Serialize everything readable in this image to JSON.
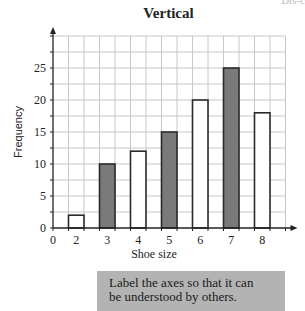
{
  "page_corner": "Dis-c",
  "title": "Vertical",
  "callout": {
    "line1": "Label the axes so that it can",
    "line2": "be understood by others."
  },
  "colors": {
    "grid": "#c8c8c8",
    "axis": "#222222",
    "bar_outline": "#2a2a2a",
    "bar_shaded": "#7a7a7a",
    "bar_unshaded": "#ffffff",
    "callout_bg": "#b3b3b3"
  },
  "chart_data": {
    "type": "bar",
    "title": "Vertical",
    "xlabel": "Shoe size",
    "ylabel": "Frequency",
    "categories": [
      "2",
      "3",
      "4",
      "5",
      "6",
      "7",
      "8"
    ],
    "values": [
      2,
      10,
      12,
      15,
      20,
      25,
      18
    ],
    "shaded": [
      false,
      true,
      false,
      true,
      false,
      true,
      false
    ],
    "x_tick_labels": [
      "0",
      "2",
      "3",
      "4",
      "5",
      "6",
      "7",
      "8"
    ],
    "y_ticks": [
      0,
      5,
      10,
      15,
      20,
      25
    ],
    "ylim": [
      0,
      30
    ],
    "grid": true,
    "legend": null
  }
}
